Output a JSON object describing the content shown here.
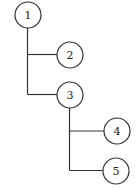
{
  "diagram": {
    "type": "tree",
    "colors": {
      "stroke": "#333333",
      "fill": "#ffffff",
      "text": "#222222"
    },
    "nodes": [
      {
        "id": "1",
        "label": "1",
        "cx": 28,
        "cy": 15,
        "r": 13
      },
      {
        "id": "2",
        "label": "2",
        "cx": 70,
        "cy": 55,
        "r": 13
      },
      {
        "id": "3",
        "label": "3",
        "cx": 70,
        "cy": 95,
        "r": 13
      },
      {
        "id": "4",
        "label": "4",
        "cx": 117,
        "cy": 131,
        "r": 13
      },
      {
        "id": "5",
        "label": "5",
        "cx": 116,
        "cy": 171,
        "r": 13
      }
    ],
    "edges": [
      {
        "from": "1",
        "to": "2"
      },
      {
        "from": "1",
        "to": "3"
      },
      {
        "from": "3",
        "to": "4"
      },
      {
        "from": "3",
        "to": "5"
      }
    ]
  }
}
